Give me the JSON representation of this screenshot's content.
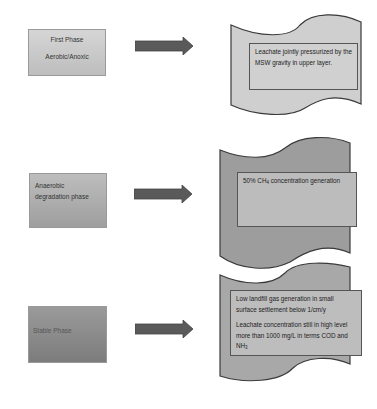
{
  "diagram": {
    "type": "landfill-phase-flow",
    "colors": {
      "phase1_fill": "#c8c8c8",
      "phase2_fill": "#aeaeae",
      "phase3_fill": "#8a8a8a",
      "arrow_fill": "#5a5a5a",
      "wave1_fill": "#cfcfcf",
      "wave2_fill": "#9d9d9d",
      "wave3_fill": "#a8a8a8"
    },
    "phases": [
      {
        "label_line1": "First Phase",
        "label_line2": "Aerobic/Anoxic",
        "description": "Leachate jointly pressurized by the MSW gravity in upper layer."
      },
      {
        "label_line1": "Anaerobic",
        "label_line2": "degradation phase",
        "description_prefix": "50% CH",
        "description_sub": "4",
        "description_suffix": " concentration generation"
      },
      {
        "label_line1": "Stable Phase",
        "description_a": "Low landfill gas generation in small surface settlement below 1/cm/y",
        "description_b_prefix": "Leachate concentration still in high level more than 1000 mg/L in terms COD and NH",
        "description_b_sub": "3"
      }
    ]
  }
}
